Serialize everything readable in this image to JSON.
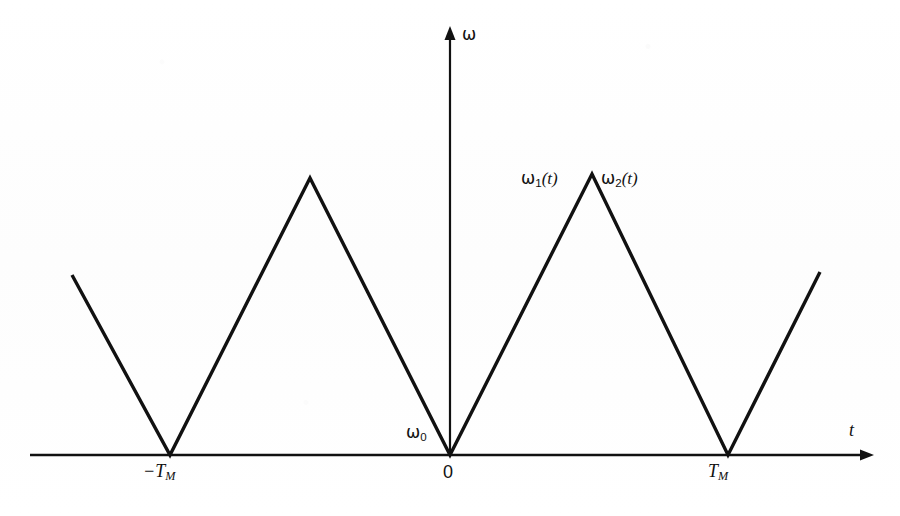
{
  "figure": {
    "background_color": "#fefefe",
    "stroke_color": "#111111",
    "axis_color": "#111111",
    "waveform_stroke_width": 3.4,
    "axis_stroke_width": 2.4
  },
  "axes": {
    "y_axis_label": "ω",
    "x_axis_label": "t",
    "origin_label": "0",
    "x_tick_left_label": "−T",
    "x_tick_left_sub": "M",
    "x_tick_right_label": "T",
    "x_tick_right_sub": "M",
    "baseline_label": "ω",
    "baseline_sub": "0"
  },
  "annotations": {
    "omega1_symbol": "ω",
    "omega1_sub": "1",
    "omega1_arg": "(t)",
    "omega2_symbol": "ω",
    "omega2_sub": "2",
    "omega2_arg": "(t)"
  },
  "chart_data": {
    "type": "line",
    "title": "",
    "xlabel": "t",
    "ylabel": "ω",
    "grid": false,
    "legend": false,
    "xlim": [
      -1.98,
      2.65
    ],
    "ylim": [
      0,
      1.12
    ],
    "x_ticks": [
      -1,
      0,
      1
    ],
    "x_tick_labels": [
      "-T_M",
      "0",
      "T_M"
    ],
    "y_ticks": [
      0
    ],
    "y_tick_labels": [
      "ω₀"
    ],
    "series": [
      {
        "name": "ω(t)",
        "x": [
          -1.7,
          -1.0,
          0.0,
          1.0,
          1.97
        ],
        "y": [
          0.64,
          0.0,
          1.0,
          0.0,
          0.66
        ],
        "points_px": [
          [
            72,
            275
          ],
          [
            170,
            455
          ],
          [
            310,
            178
          ],
          [
            450,
            455
          ],
          [
            592,
            174
          ],
          [
            728,
            455
          ],
          [
            820,
            272
          ]
        ]
      }
    ],
    "annotations": [
      {
        "text": "ω₁(t)",
        "x": -0.12,
        "y": 1.02,
        "role": "up-sweep-label"
      },
      {
        "text": "ω₂(t)",
        "x": 0.42,
        "y": 1.02,
        "role": "down-sweep-label"
      },
      {
        "text": "ω₀",
        "x": -0.3,
        "y": 0.06,
        "role": "baseline-frequency"
      }
    ]
  }
}
